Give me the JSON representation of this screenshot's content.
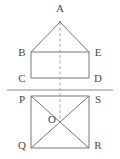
{
  "figure": {
    "canvas": {
      "width": 120,
      "height": 159
    },
    "colors": {
      "background": "#ffffff",
      "stroke": "#767676",
      "ground_line": "#8a8a8a",
      "dashed_axis": "#9a9a9a",
      "label_text": "#4a4a4a"
    },
    "stroke_width": 1,
    "points": {
      "A": {
        "x": 60,
        "y": 22,
        "label": "A",
        "label_x": 60,
        "label_y": 8
      },
      "B": {
        "x": 31,
        "y": 52,
        "label": "B",
        "label_x": 22,
        "label_y": 52
      },
      "E": {
        "x": 89,
        "y": 52,
        "label": "E",
        "label_x": 98,
        "label_y": 52
      },
      "C": {
        "x": 31,
        "y": 78,
        "label": "C",
        "label_x": 22,
        "label_y": 78
      },
      "D": {
        "x": 89,
        "y": 78,
        "label": "D",
        "label_x": 98,
        "label_y": 78
      },
      "P": {
        "x": 31,
        "y": 96,
        "label": "P",
        "label_x": 22,
        "label_y": 99
      },
      "S": {
        "x": 89,
        "y": 96,
        "label": "S",
        "label_x": 98,
        "label_y": 99
      },
      "Q": {
        "x": 31,
        "y": 148,
        "label": "Q",
        "label_x": 22,
        "label_y": 145
      },
      "R": {
        "x": 89,
        "y": 148,
        "label": "R",
        "label_x": 98,
        "label_y": 145
      },
      "O": {
        "x": 60,
        "y": 122,
        "label": "O",
        "label_x": 52,
        "label_y": 119
      }
    },
    "ground_line": {
      "x1": 7,
      "y1": 90,
      "x2": 113,
      "y2": 90
    },
    "dashed_axis": {
      "x1": 60,
      "y1": 22,
      "x2": 60,
      "y2": 122
    },
    "shapes": {
      "triangle": "A-B-E",
      "rectangle": "B-E-D-C",
      "square": "P-S-R-Q",
      "diagonals": [
        "P-R",
        "S-Q"
      ]
    }
  }
}
